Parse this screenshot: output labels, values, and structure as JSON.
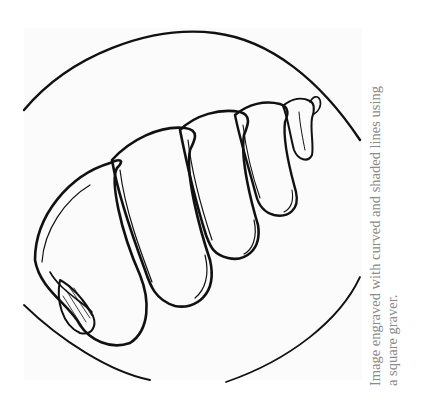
{
  "figure": {
    "colors": {
      "line": "#111111",
      "background": "#ffffff",
      "plate": "#fbfbfb",
      "caption": "#8a8a8a"
    }
  },
  "caption": {
    "line1": "Image engraved with curved and shaded lines using",
    "line2": "a square graver."
  }
}
